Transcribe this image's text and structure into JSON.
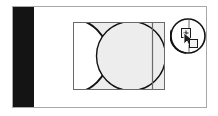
{
  "app": {
    "view_name": "vector-canvas",
    "background_color": "#ffffff"
  },
  "document_frame": {
    "name": "document-border",
    "border_color": "#a8a8a8",
    "fill_color": "#ffffff",
    "x": 12,
    "y": 6,
    "width": 195,
    "height": 102
  },
  "panels": [
    {
      "name": "black-side-panel",
      "color": "#141414",
      "x": 13,
      "y": 7,
      "width": 21,
      "height": 100
    }
  ],
  "artwork": {
    "name": "compound-shape",
    "x": 73,
    "y": 22,
    "width": 92,
    "height": 68,
    "fill_color": "#ededed",
    "stroke_color": "#111111",
    "outline_color": "#555555",
    "shapes": [
      {
        "type": "rectangle",
        "name": "base-rectangle",
        "x": 0,
        "y": 0,
        "width": 92,
        "height": 68
      },
      {
        "type": "circle",
        "name": "left-subtracted-circle",
        "cx": 0,
        "cy": 34,
        "r": 36
      },
      {
        "type": "circle",
        "name": "center-circle",
        "cx": 58,
        "cy": 34,
        "r": 34
      },
      {
        "type": "line",
        "name": "vertical-guide",
        "x": 79,
        "y1": 0,
        "y2": 68
      }
    ]
  },
  "magnifier": {
    "name": "zoom-preview-circle",
    "x": 170,
    "y": 18,
    "diameter": 36,
    "stroke_color": "#111111",
    "fill_color": "#ffffff"
  },
  "tool": {
    "name": "zoom-in-cursor",
    "glyph": "+",
    "marker_label": "+",
    "x": 181,
    "y": 28
  },
  "selection_handle": {
    "name": "selection-handle",
    "x": 189,
    "y": 39,
    "size": 9,
    "fill_color": "#f2f2f2",
    "stroke_color": "#1a1a1a"
  }
}
